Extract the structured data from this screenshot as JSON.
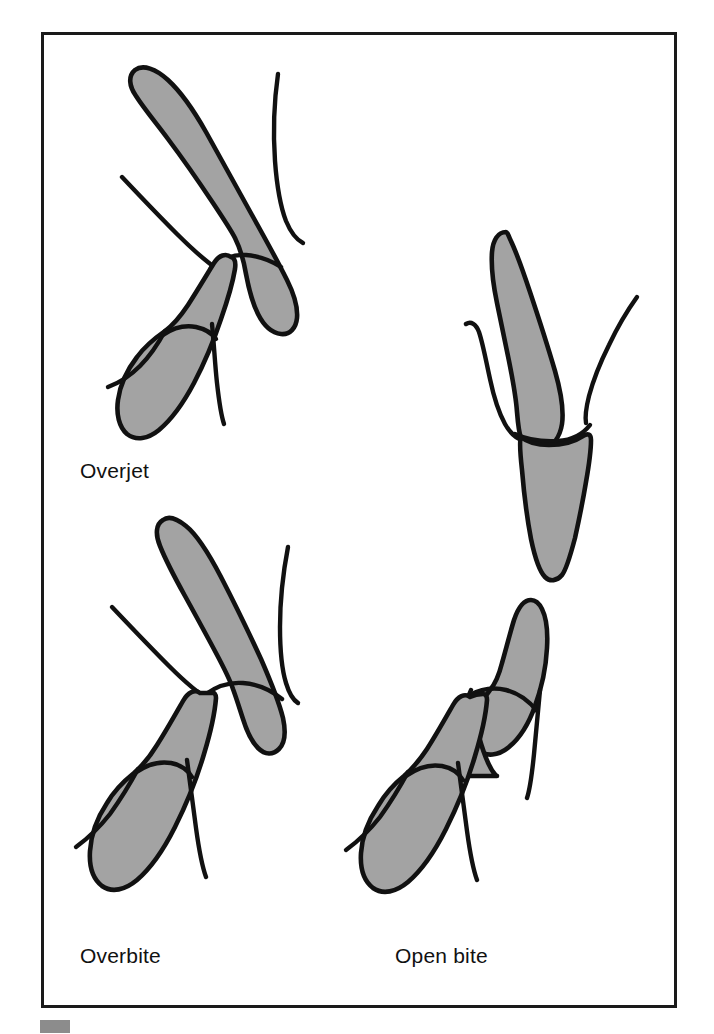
{
  "figure": {
    "background_color": "#ffffff",
    "frame": {
      "x": 41,
      "y": 32,
      "width": 636,
      "height": 976,
      "border_color": "#1a1a1a",
      "fill_color": "#ffffff"
    },
    "corner_mark": {
      "x": 40,
      "y": 1020,
      "width": 30,
      "height": 13,
      "color": "#8c8c8c"
    },
    "colors": {
      "tooth_fill": "#a3a3a3",
      "outline": "#111111",
      "label_text": "#111111"
    },
    "labels": [
      {
        "id": "overjet",
        "text": "Overjet",
        "x": 80,
        "y": 478
      },
      {
        "id": "overbite",
        "text": "Overbite",
        "x": 80,
        "y": 963
      },
      {
        "id": "open-bite",
        "text": "Open bite",
        "x": 395,
        "y": 963
      }
    ],
    "panels": [
      {
        "id": "overjet",
        "label": "Overjet",
        "description": "Upper incisor protrudes horizontally beyond the lower incisor",
        "upper_tooth": {
          "position": "upper-left",
          "tilt": "forward"
        },
        "lower_tooth": {
          "position": "lower-left",
          "tilt": "forward"
        }
      },
      {
        "id": "normal-reference",
        "label": "",
        "description": "Upper and lower incisors meeting edge to edge",
        "upper_tooth": {
          "position": "upper-right",
          "tilt": "upright"
        },
        "lower_tooth": {
          "position": "lower-right",
          "tilt": "upright"
        }
      },
      {
        "id": "overbite",
        "label": "Overbite",
        "description": "Upper incisor vertically overlaps the lower incisor",
        "upper_tooth": {
          "position": "upper-left",
          "tilt": "upright"
        },
        "lower_tooth": {
          "position": "lower-left",
          "tilt": "forward"
        }
      },
      {
        "id": "open-bite",
        "label": "Open bite",
        "description": "Upper and lower incisors do not meet, leaving a vertical gap",
        "upper_tooth": {
          "position": "upper-right",
          "tilt": "forward"
        },
        "lower_tooth": {
          "position": "lower-right",
          "tilt": "forward"
        }
      }
    ]
  }
}
